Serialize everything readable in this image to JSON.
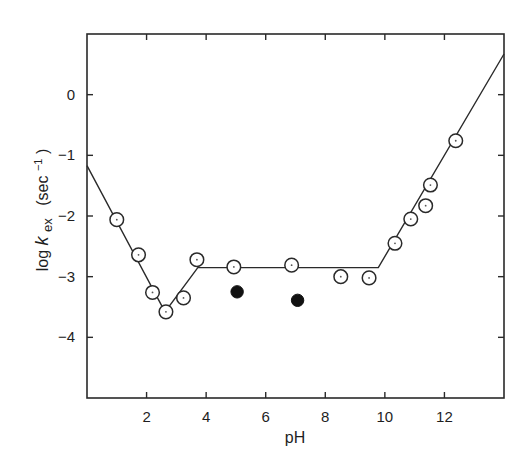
{
  "chart_data": {
    "type": "scatter",
    "title": "",
    "xlabel": "pH",
    "ylabel": "log k_ex (sec⁻¹)",
    "ylabel_parts": {
      "prefix": "log ",
      "k": "k",
      "subscript": "ex",
      "unit": "(sec",
      "unit_sup": "−1",
      "unit_close": ")"
    },
    "xlim": [
      0,
      14
    ],
    "ylim": [
      -5,
      1
    ],
    "grid": false,
    "legend": null,
    "x_ticks": [
      2,
      4,
      6,
      8,
      10,
      12
    ],
    "x_tick_labels": [
      "2",
      "4",
      "6",
      "8",
      "10",
      "12"
    ],
    "y_ticks": [
      0,
      -1,
      -2,
      -3,
      -4
    ],
    "y_tick_labels": [
      "0",
      "-1",
      "-2",
      "-3",
      "-4"
    ],
    "series": [
      {
        "name": "open circles",
        "marker": "open-circle-dot",
        "points": [
          {
            "x": 1.0,
            "y": -2.06
          },
          {
            "x": 1.73,
            "y": -2.64
          },
          {
            "x": 2.2,
            "y": -3.26
          },
          {
            "x": 2.65,
            "y": -3.58
          },
          {
            "x": 3.24,
            "y": -3.35
          },
          {
            "x": 3.69,
            "y": -2.72
          },
          {
            "x": 4.93,
            "y": -2.84
          },
          {
            "x": 6.87,
            "y": -2.81
          },
          {
            "x": 8.52,
            "y": -3.0
          },
          {
            "x": 9.47,
            "y": -3.02
          },
          {
            "x": 10.34,
            "y": -2.45
          },
          {
            "x": 10.87,
            "y": -2.05
          },
          {
            "x": 11.37,
            "y": -1.83
          },
          {
            "x": 11.53,
            "y": -1.49
          },
          {
            "x": 12.38,
            "y": -0.76
          }
        ]
      },
      {
        "name": "filled circles",
        "marker": "filled-circle",
        "points": [
          {
            "x": 5.04,
            "y": -3.25
          },
          {
            "x": 7.07,
            "y": -3.39
          }
        ]
      }
    ],
    "fit_line": {
      "name": "piecewise fit",
      "points": [
        {
          "x": 0.0,
          "y": -1.17
        },
        {
          "x": 2.62,
          "y": -3.58
        },
        {
          "x": 3.72,
          "y": -2.85
        },
        {
          "x": 9.78,
          "y": -2.85
        },
        {
          "x": 14.0,
          "y": 0.67
        }
      ]
    }
  }
}
